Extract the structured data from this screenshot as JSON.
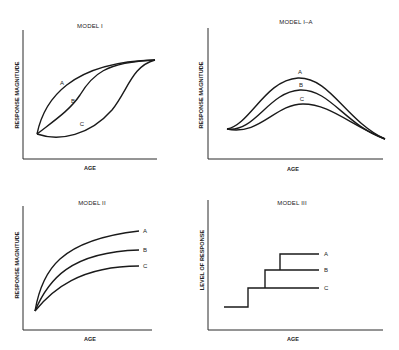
{
  "panels": [
    {
      "title": "MODEL I",
      "ylabel": "RESPONSE MAGNITUDE",
      "xlabel": "AGE",
      "curves": [
        {
          "label": "A",
          "shape": "concave rise to common plateau"
        },
        {
          "label": "B",
          "shape": "sigmoid rise to common plateau"
        },
        {
          "label": "C",
          "shape": "delayed convex rise to common plateau"
        }
      ]
    },
    {
      "title": "MODEL I–A",
      "ylabel": "RESPONSE MAGNITUDE",
      "xlabel": "AGE",
      "curves": [
        {
          "label": "A",
          "shape": "rise to highest peak then decline"
        },
        {
          "label": "B",
          "shape": "rise to middle peak then decline"
        },
        {
          "label": "C",
          "shape": "rise to lowest peak then decline"
        }
      ]
    },
    {
      "title": "MODEL II",
      "ylabel": "RESPONSE MAGNITUDE",
      "xlabel": "AGE",
      "curves": [
        {
          "label": "A",
          "shape": "rise to highest asymptote"
        },
        {
          "label": "B",
          "shape": "rise to middle asymptote"
        },
        {
          "label": "C",
          "shape": "rise to lowest asymptote"
        }
      ]
    },
    {
      "title": "MODEL III",
      "ylabel": "LEVEL OF RESPONSE",
      "xlabel": "AGE",
      "curves": [
        {
          "label": "A",
          "shape": "three-step staircase"
        },
        {
          "label": "B",
          "shape": "two-step staircase"
        },
        {
          "label": "C",
          "shape": "one-step staircase"
        }
      ]
    }
  ]
}
